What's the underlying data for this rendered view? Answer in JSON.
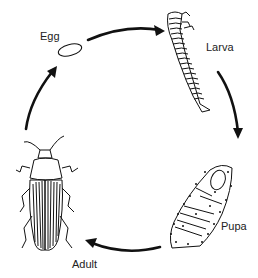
{
  "stages": [
    {
      "id": "egg",
      "label": "Egg"
    },
    {
      "id": "larva",
      "label": "Larva"
    },
    {
      "id": "pupa",
      "label": "Pupa"
    },
    {
      "id": "adult",
      "label": "Adult"
    }
  ],
  "flow": [
    {
      "from": "Egg",
      "to": "Larva"
    },
    {
      "from": "Larva",
      "to": "Pupa"
    },
    {
      "from": "Pupa",
      "to": "Adult"
    },
    {
      "from": "Adult",
      "to": "Egg"
    }
  ],
  "colors": {
    "line": "#111111",
    "background": "#ffffff",
    "label": "#222222"
  }
}
